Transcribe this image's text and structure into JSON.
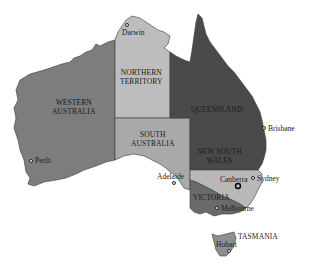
{
  "map": {
    "title": "Australia states and territories",
    "colors": {
      "western_australia": "#7d7d7d",
      "northern_territory": "#bdbdbd",
      "south_australia": "#a9a9a9",
      "queensland": "#4a4a4a",
      "new_south_wales": "#b8b8b8",
      "victoria": "#6a6a6a",
      "tasmania": "#8e8e8e",
      "border": "#3a3a3a",
      "background": "#ffffff"
    },
    "regions": [
      {
        "id": "wa",
        "line1": "WESTERN",
        "line2": "AUSTRALIA"
      },
      {
        "id": "nt",
        "line1": "NORTHERN",
        "line2": "TERRITORY"
      },
      {
        "id": "sa",
        "line1": "SOUTH",
        "line2": "AUSTRALIA"
      },
      {
        "id": "qld",
        "line1": "QUEENSLAND",
        "line2": ""
      },
      {
        "id": "nsw",
        "line1": "NEW SOUTH",
        "line2": "WALES"
      },
      {
        "id": "vic",
        "line1": "VICTORIA",
        "line2": ""
      },
      {
        "id": "tas",
        "line1": "TASMANIA",
        "line2": ""
      }
    ],
    "cities": [
      {
        "name": "Darwin",
        "capital_of": "Northern Territory"
      },
      {
        "name": "Brisbane",
        "capital_of": "Queensland"
      },
      {
        "name": "Perth",
        "capital_of": "Western Australia"
      },
      {
        "name": "Adelaide",
        "capital_of": "South Australia"
      },
      {
        "name": "Canberra",
        "capital_of": "Australia"
      },
      {
        "name": "Sydney",
        "capital_of": "New South Wales"
      },
      {
        "name": "Melbourne",
        "capital_of": "Victoria"
      },
      {
        "name": "Hobart",
        "capital_of": "Tasmania"
      }
    ]
  }
}
